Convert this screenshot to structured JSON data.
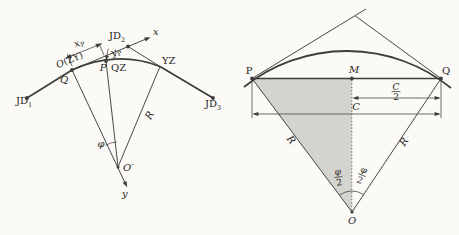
{
  "figure": {
    "left": {
      "jd1": {
        "base": "JD",
        "sub": "1"
      },
      "jd2": {
        "base": "JD",
        "sub": "2"
      },
      "jd3": {
        "base": "JD",
        "sub": "3"
      },
      "axis_x": "x",
      "axis_y": "y",
      "origin_sym": "O",
      "origin_tag": "(ZY)",
      "q": "Q",
      "p": "P",
      "qz": "QZ",
      "yz": "YZ",
      "dim_x": {
        "base": "x",
        "sub": "P"
      },
      "dim_y": {
        "base": "y",
        "sub": "P"
      },
      "angle": "φ",
      "radius": "R",
      "center": "O′"
    },
    "right": {
      "p": "P",
      "m": "M",
      "q": "Q",
      "half_chord": {
        "num": "C",
        "den": "2"
      },
      "chord": "C",
      "radius_left": "R",
      "radius_right": "R",
      "angle_left": {
        "num": "φ",
        "den": "2"
      },
      "angle_right": {
        "num": "φ",
        "den": "2"
      },
      "center": "O"
    }
  }
}
